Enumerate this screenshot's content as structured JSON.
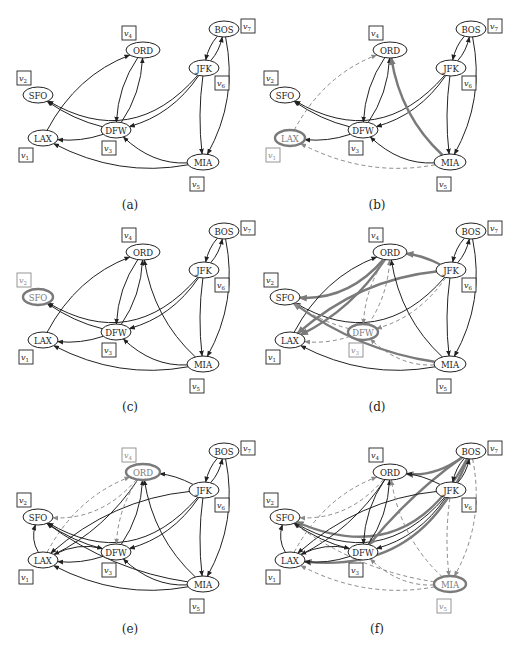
{
  "figure": {
    "colors": {
      "normal": "#222222",
      "highlight": "#7a7a7a",
      "dashed": "#8a8a8a",
      "background": "#ffffff"
    },
    "nodes": [
      {
        "id": "SFO",
        "label": "SFO",
        "vertex": "v2"
      },
      {
        "id": "LAX",
        "label": "LAX",
        "vertex": "v1"
      },
      {
        "id": "DFW",
        "label": "DFW",
        "vertex": "v3"
      },
      {
        "id": "ORD",
        "label": "ORD",
        "vertex": "v4"
      },
      {
        "id": "JFK",
        "label": "JFK",
        "vertex": "v6"
      },
      {
        "id": "BOS",
        "label": "BOS",
        "vertex": "v7"
      },
      {
        "id": "MIA",
        "label": "MIA",
        "vertex": "v5"
      }
    ],
    "vertex_labels": {
      "v1": "v1",
      "v2": "v2",
      "v3": "v3",
      "v4": "v4",
      "v5": "v5",
      "v6": "v6",
      "v7": "v7"
    },
    "panels": [
      {
        "caption": "(a)",
        "highlighted_node": null,
        "edges": [
          {
            "from": "JFK",
            "to": "SFO",
            "style": "normal"
          },
          {
            "from": "LAX",
            "to": "ORD",
            "style": "normal"
          },
          {
            "from": "ORD",
            "to": "DFW",
            "style": "normal"
          },
          {
            "from": "DFW",
            "to": "ORD",
            "style": "normal"
          },
          {
            "from": "DFW",
            "to": "SFO",
            "style": "normal"
          },
          {
            "from": "DFW",
            "to": "LAX",
            "style": "normal"
          },
          {
            "from": "JFK",
            "to": "DFW",
            "style": "normal"
          },
          {
            "from": "BOS",
            "to": "JFK",
            "style": "normal"
          },
          {
            "from": "JFK",
            "to": "BOS",
            "style": "normal"
          },
          {
            "from": "JFK",
            "to": "MIA",
            "style": "normal"
          },
          {
            "from": "BOS",
            "to": "MIA",
            "style": "normal"
          },
          {
            "from": "MIA",
            "to": "DFW",
            "style": "normal"
          },
          {
            "from": "MIA",
            "to": "LAX",
            "style": "normal"
          }
        ]
      },
      {
        "caption": "(b)",
        "highlighted_node": "LAX",
        "edges": [
          {
            "from": "JFK",
            "to": "SFO",
            "style": "normal"
          },
          {
            "from": "LAX",
            "to": "ORD",
            "style": "dashed"
          },
          {
            "from": "ORD",
            "to": "DFW",
            "style": "normal"
          },
          {
            "from": "DFW",
            "to": "ORD",
            "style": "normal"
          },
          {
            "from": "DFW",
            "to": "SFO",
            "style": "normal"
          },
          {
            "from": "DFW",
            "to": "LAX",
            "style": "normal"
          },
          {
            "from": "JFK",
            "to": "DFW",
            "style": "normal"
          },
          {
            "from": "BOS",
            "to": "JFK",
            "style": "normal"
          },
          {
            "from": "JFK",
            "to": "BOS",
            "style": "normal"
          },
          {
            "from": "JFK",
            "to": "MIA",
            "style": "normal"
          },
          {
            "from": "BOS",
            "to": "MIA",
            "style": "normal"
          },
          {
            "from": "MIA",
            "to": "DFW",
            "style": "normal"
          },
          {
            "from": "MIA",
            "to": "LAX",
            "style": "dashed"
          },
          {
            "from": "MIA",
            "to": "ORD",
            "style": "bold"
          }
        ]
      },
      {
        "caption": "(c)",
        "highlighted_node": "SFO",
        "edges": [
          {
            "from": "JFK",
            "to": "SFO",
            "style": "normal"
          },
          {
            "from": "LAX",
            "to": "ORD",
            "style": "normal"
          },
          {
            "from": "ORD",
            "to": "DFW",
            "style": "normal"
          },
          {
            "from": "DFW",
            "to": "ORD",
            "style": "normal"
          },
          {
            "from": "DFW",
            "to": "SFO",
            "style": "normal"
          },
          {
            "from": "DFW",
            "to": "LAX",
            "style": "normal"
          },
          {
            "from": "JFK",
            "to": "DFW",
            "style": "normal"
          },
          {
            "from": "BOS",
            "to": "JFK",
            "style": "normal"
          },
          {
            "from": "JFK",
            "to": "BOS",
            "style": "normal"
          },
          {
            "from": "JFK",
            "to": "MIA",
            "style": "normal"
          },
          {
            "from": "BOS",
            "to": "MIA",
            "style": "normal"
          },
          {
            "from": "MIA",
            "to": "DFW",
            "style": "normal"
          },
          {
            "from": "MIA",
            "to": "LAX",
            "style": "normal"
          },
          {
            "from": "MIA",
            "to": "ORD",
            "style": "normal"
          }
        ]
      },
      {
        "caption": "(d)",
        "highlighted_node": "DFW",
        "edges": [
          {
            "from": "JFK",
            "to": "SFO",
            "style": "normal"
          },
          {
            "from": "ORD",
            "to": "SFO",
            "style": "bold"
          },
          {
            "from": "LAX",
            "to": "ORD",
            "style": "normal"
          },
          {
            "from": "ORD",
            "to": "LAX",
            "style": "bold"
          },
          {
            "from": "JFK",
            "to": "LAX",
            "style": "bold"
          },
          {
            "from": "JFK",
            "to": "ORD",
            "style": "bold"
          },
          {
            "from": "MIA",
            "to": "SFO",
            "style": "bold"
          },
          {
            "from": "ORD",
            "to": "DFW",
            "style": "dashed"
          },
          {
            "from": "DFW",
            "to": "ORD",
            "style": "dashed"
          },
          {
            "from": "DFW",
            "to": "SFO",
            "style": "dashed"
          },
          {
            "from": "DFW",
            "to": "LAX",
            "style": "dashed"
          },
          {
            "from": "JFK",
            "to": "DFW",
            "style": "dashed"
          },
          {
            "from": "MIA",
            "to": "DFW",
            "style": "dashed"
          },
          {
            "from": "BOS",
            "to": "JFK",
            "style": "normal"
          },
          {
            "from": "JFK",
            "to": "BOS",
            "style": "normal"
          },
          {
            "from": "JFK",
            "to": "MIA",
            "style": "normal"
          },
          {
            "from": "BOS",
            "to": "MIA",
            "style": "normal"
          },
          {
            "from": "MIA",
            "to": "LAX",
            "style": "normal"
          },
          {
            "from": "MIA",
            "to": "ORD",
            "style": "normal"
          }
        ]
      },
      {
        "caption": "(e)",
        "highlighted_node": "ORD",
        "edges": [
          {
            "from": "JFK",
            "to": "SFO",
            "style": "normal"
          },
          {
            "from": "ORD",
            "to": "SFO",
            "style": "dashed"
          },
          {
            "from": "LAX",
            "to": "ORD",
            "style": "dashed"
          },
          {
            "from": "ORD",
            "to": "LAX",
            "style": "normal"
          },
          {
            "from": "JFK",
            "to": "LAX",
            "style": "normal"
          },
          {
            "from": "JFK",
            "to": "ORD",
            "style": "normal"
          },
          {
            "from": "MIA",
            "to": "SFO",
            "style": "normal"
          },
          {
            "from": "ORD",
            "to": "DFW",
            "style": "dashed"
          },
          {
            "from": "DFW",
            "to": "ORD",
            "style": "normal"
          },
          {
            "from": "DFW",
            "to": "SFO",
            "style": "normal"
          },
          {
            "from": "DFW",
            "to": "LAX",
            "style": "normal"
          },
          {
            "from": "LAX",
            "to": "DFW",
            "style": "normal"
          },
          {
            "from": "LAX",
            "to": "SFO",
            "style": "normal"
          },
          {
            "from": "JFK",
            "to": "DFW",
            "style": "normal"
          },
          {
            "from": "MIA",
            "to": "DFW",
            "style": "normal"
          },
          {
            "from": "BOS",
            "to": "JFK",
            "style": "normal"
          },
          {
            "from": "JFK",
            "to": "BOS",
            "style": "normal"
          },
          {
            "from": "JFK",
            "to": "MIA",
            "style": "normal"
          },
          {
            "from": "BOS",
            "to": "MIA",
            "style": "normal"
          },
          {
            "from": "MIA",
            "to": "LAX",
            "style": "normal"
          },
          {
            "from": "MIA",
            "to": "ORD",
            "style": "normal"
          }
        ]
      },
      {
        "caption": "(f)",
        "highlighted_node": "MIA",
        "edges": [
          {
            "from": "JFK",
            "to": "SFO",
            "style": "normal"
          },
          {
            "from": "BOS",
            "to": "SFO",
            "style": "bold"
          },
          {
            "from": "BOS",
            "to": "ORD",
            "style": "bold"
          },
          {
            "from": "BOS",
            "to": "DFW",
            "style": "bold"
          },
          {
            "from": "BOS",
            "to": "LAX",
            "style": "bold"
          },
          {
            "from": "ORD",
            "to": "SFO",
            "style": "dashed"
          },
          {
            "from": "LAX",
            "to": "ORD",
            "style": "dashed"
          },
          {
            "from": "ORD",
            "to": "LAX",
            "style": "normal"
          },
          {
            "from": "JFK",
            "to": "LAX",
            "style": "normal"
          },
          {
            "from": "JFK",
            "to": "ORD",
            "style": "normal"
          },
          {
            "from": "MIA",
            "to": "SFO",
            "style": "dashed"
          },
          {
            "from": "ORD",
            "to": "DFW",
            "style": "normal"
          },
          {
            "from": "DFW",
            "to": "ORD",
            "style": "normal"
          },
          {
            "from": "DFW",
            "to": "SFO",
            "style": "normal"
          },
          {
            "from": "DFW",
            "to": "LAX",
            "style": "normal"
          },
          {
            "from": "LAX",
            "to": "DFW",
            "style": "normal"
          },
          {
            "from": "LAX",
            "to": "SFO",
            "style": "normal"
          },
          {
            "from": "JFK",
            "to": "DFW",
            "style": "normal"
          },
          {
            "from": "MIA",
            "to": "DFW",
            "style": "dashed"
          },
          {
            "from": "BOS",
            "to": "JFK",
            "style": "normal"
          },
          {
            "from": "JFK",
            "to": "BOS",
            "style": "normal"
          },
          {
            "from": "JFK",
            "to": "MIA",
            "style": "dashed"
          },
          {
            "from": "BOS",
            "to": "MIA",
            "style": "dashed"
          },
          {
            "from": "MIA",
            "to": "LAX",
            "style": "dashed"
          },
          {
            "from": "MIA",
            "to": "ORD",
            "style": "dashed"
          }
        ]
      }
    ]
  }
}
